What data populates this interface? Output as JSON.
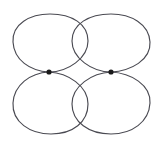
{
  "figure": {
    "background_color": "#ffffff",
    "stroke_color": "#4a4a52",
    "vertex_color": "#1a1a1a",
    "stroke_width": 1.15,
    "canvas": {
      "width": 162,
      "height": 146
    }
  },
  "chart_data": {
    "type": "diagram",
    "xlabel": "",
    "ylabel": "",
    "xlim": [
      0,
      162
    ],
    "ylim": [
      0,
      146
    ],
    "grid": false,
    "legend": "none",
    "vertices": [
      {
        "id": "v1",
        "label": "left-vertex",
        "x": 49,
        "y": 72,
        "radius": 2.6
      },
      {
        "id": "v2",
        "label": "right-vertex",
        "x": 111,
        "y": 72,
        "radius": 2.6
      }
    ],
    "loops": [
      {
        "id": "loop-top-left",
        "label": "top-left-loop",
        "attached_vertex": "v1",
        "quadrant": "top-left",
        "bbox": {
          "x": 13,
          "y": 14,
          "width": 76,
          "height": 58
        },
        "path": "M 49 72 C 30 71 14 60 13 42 C 12 24 30 14 50 14 C 72 14 88 24 88 41 C 88 58 68 72 49 72 Z"
      },
      {
        "id": "loop-top-right",
        "label": "top-right-loop",
        "attached_vertex": "v2",
        "quadrant": "top-right",
        "bbox": {
          "x": 71,
          "y": 14,
          "width": 80,
          "height": 58
        },
        "path": "M 111 72 C 92 72 72 58 72 41 C 72 24 89 14 111 14 C 131 14 149 24 150 42 C 151 60 131 71 111 72 Z"
      },
      {
        "id": "loop-bottom-left",
        "label": "bottom-left-loop",
        "attached_vertex": "v1",
        "quadrant": "bottom-left",
        "bbox": {
          "x": 13,
          "y": 72,
          "width": 76,
          "height": 62
        },
        "path": "M 49 72 C 30 73 14 85 13 103 C 12 122 30 134 51 134 C 73 134 88 122 88 104 C 88 86 68 73 49 72 Z"
      },
      {
        "id": "loop-bottom-right",
        "label": "bottom-right-loop",
        "attached_vertex": "v2",
        "quadrant": "bottom-right",
        "bbox": {
          "x": 71,
          "y": 72,
          "width": 80,
          "height": 62
        },
        "path": "M 111 72 C 92 73 72 86 72 104 C 72 122 89 134 111 134 C 132 134 149 122 150 103 C 151 85 131 73 111 72 Z"
      }
    ],
    "crossings": [
      {
        "id": "x-top",
        "label": "top-lens-crossing",
        "x": 81,
        "y": 16
      },
      {
        "id": "x-bottom",
        "label": "bottom-lens-crossing",
        "x": 81,
        "y": 131
      }
    ],
    "annotations": []
  }
}
